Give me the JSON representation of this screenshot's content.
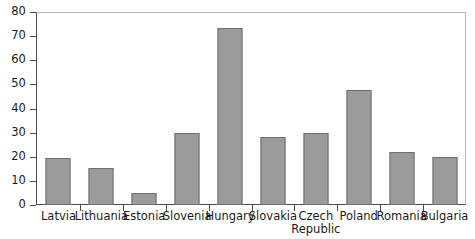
{
  "chart_data": {
    "type": "bar",
    "title": "",
    "subtitle": "",
    "xlabel": "",
    "ylabel": "",
    "ylim": [
      0,
      80
    ],
    "ytick_step": 10,
    "yticks": [
      80,
      70,
      60,
      50,
      40,
      30,
      20,
      10,
      0
    ],
    "ytick_labels": [
      "80",
      "70",
      "60",
      "50",
      "40",
      "30",
      "20",
      "10",
      "0"
    ],
    "grid": false,
    "legend": null,
    "legend_position": "none",
    "categories": [
      "Latvia",
      "Lithuania",
      "Estonia",
      "Slovenia",
      "Hungary",
      "Slovakia",
      "Czech\nRepublic",
      "Poland",
      "Romania",
      "Bulgaria"
    ],
    "values": [
      19.3,
      15.5,
      4.8,
      29.8,
      73.3,
      28.0,
      29.8,
      47.8,
      22.0,
      20.0
    ],
    "bar_color": "#9b9b9b",
    "bar_border_color": "#6f6f6f",
    "axis_color": "#4d4d4d",
    "frame_color": "#b7b7b7",
    "text_color": "#1a1a1a",
    "background": "#ffffff"
  }
}
